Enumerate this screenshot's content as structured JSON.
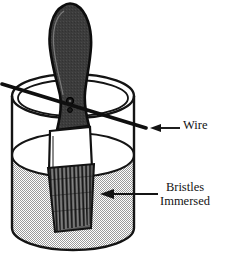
{
  "figure": {
    "background_color": "#ffffff",
    "line_color": "#141414",
    "handle_color": "#3c3c3c",
    "handle_outline_color": "#101010",
    "ferrule_color": "#ffffff",
    "bristle_color": "#2a2a2a",
    "liquid_color": "#c9c9c9",
    "container_fill": "#ffffff"
  },
  "annotations": {
    "wire": {
      "label": "Wire",
      "arrow": "arrow-left",
      "points_to": "wire-line"
    },
    "bristles": {
      "line1": "Bristles",
      "line2": "Immersed",
      "arrow": "arrow-left",
      "points_to": "bristles-bundle"
    }
  },
  "parts": {
    "container": "cylindrical-beaker",
    "liquid": "liquid-fill",
    "brush_handle": "brush-handle",
    "brush_ferrule": "brush-ferrule",
    "brush_bristles": "brush-bristles",
    "wire": "suspension-wire"
  }
}
